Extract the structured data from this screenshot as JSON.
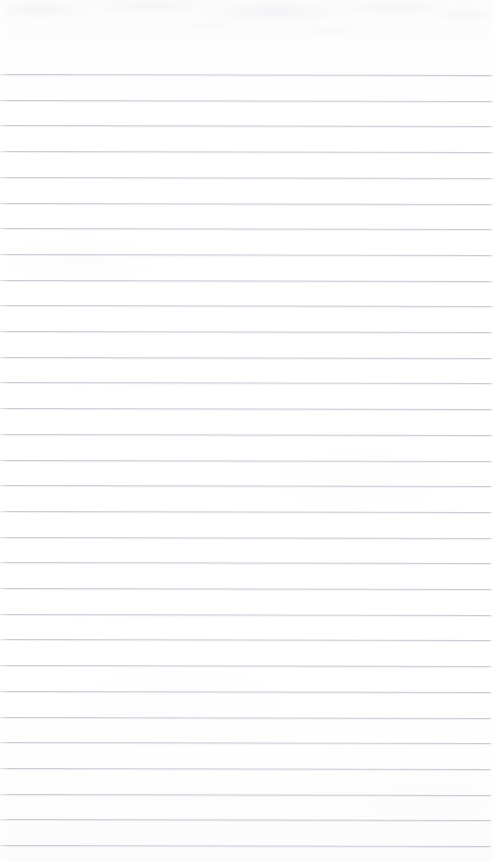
{
  "document": {
    "kind": "scanned-ruled-notebook-page",
    "orientation": "portrait",
    "page_width_px": 496,
    "page_height_px": 862,
    "text_content": "",
    "handwriting_present": "none",
    "printed_text_present": "none"
  },
  "paper": {
    "background_color": "#fefefe",
    "tint_top_color": "#fbfbfc",
    "tint_bottom_color": "#fbfbfc",
    "scan_noise": "faint mottling along top edge"
  },
  "rules": {
    "line_color": "#c3c8d2",
    "line_thickness_px": 1,
    "spacing_px": 25.7,
    "first_line_y_px": 74,
    "last_line_y_px": 845,
    "count": 31,
    "line_start_x_px": 0,
    "line_end_x_px": 493,
    "skew_degrees": 0.13,
    "y_positions": [
      74,
      99.7,
      125.4,
      151.1,
      176.8,
      202.5,
      228.2,
      253.9,
      279.6,
      305.3,
      331.0,
      356.7,
      382.4,
      408.1,
      433.8,
      459.5,
      485.2,
      510.9,
      536.6,
      562.3,
      588.0,
      613.7,
      639.4,
      665.1,
      690.8,
      716.5,
      742.2,
      767.9,
      793.6,
      819.3,
      845.0
    ]
  },
  "margins": {
    "top_margin_height_px": 74,
    "top_margin_label": "",
    "left_margin_rule": "none",
    "right_margin_rule": "none",
    "bottom_margin_height_px": 17
  }
}
